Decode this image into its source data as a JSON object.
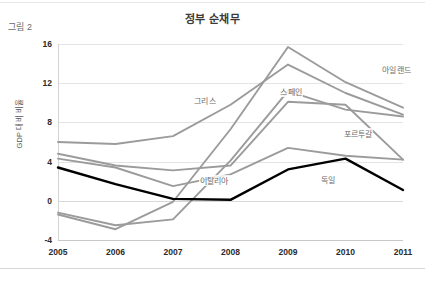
{
  "figure": {
    "caption": "그림 2"
  },
  "chart_data": {
    "type": "line",
    "title": "정부 순채무",
    "xlabel": "",
    "ylabel": "GDP 대비 비율",
    "categories": [
      "2005",
      "2006",
      "2007",
      "2008",
      "2009",
      "2010",
      "2011"
    ],
    "x": [
      2005,
      2006,
      2007,
      2008,
      2009,
      2010,
      2011
    ],
    "ylim": [
      -4,
      16
    ],
    "yticks": [
      "16",
      "12",
      "8",
      "4",
      "0",
      "-4"
    ],
    "ytick_values": [
      16,
      12,
      8,
      4,
      0,
      -4
    ],
    "grid": true,
    "legend": "inline-labels",
    "series": [
      {
        "name": "아일랜드",
        "color": "#9b9b9b",
        "width": 1.9,
        "values": [
          -1.4,
          -2.9,
          -0.1,
          7.3,
          15.7,
          12.1,
          9.5
        ],
        "label_x": 2010.62,
        "label_y": 13.5
      },
      {
        "name": "그리스",
        "color": "#9b9b9b",
        "width": 1.9,
        "values": [
          6.0,
          5.8,
          6.6,
          9.8,
          13.9,
          11.0,
          8.8
        ],
        "label_x": 2007.35,
        "label_y": 10.3
      },
      {
        "name": "스페인",
        "color": "#9b9b9b",
        "width": 1.9,
        "values": [
          -1.2,
          -2.5,
          -1.9,
          4.1,
          11.2,
          9.3,
          8.6
        ],
        "label_x": 2008.85,
        "label_y": 11.2
      },
      {
        "name": "포르투갈",
        "color": "#9b9b9b",
        "width": 1.9,
        "values": [
          4.8,
          3.6,
          3.1,
          3.6,
          10.1,
          9.8,
          4.2
        ],
        "label_x": 2009.95,
        "label_y": 6.9
      },
      {
        "name": "이탈리아",
        "color": "#9b9b9b",
        "width": 1.9,
        "values": [
          4.3,
          3.4,
          1.5,
          2.7,
          5.4,
          4.6,
          4.2
        ],
        "label_x": 2007.45,
        "label_y": 2.1
      },
      {
        "name": "독일",
        "color": "#000000",
        "width": 2.4,
        "values": [
          3.4,
          1.7,
          0.2,
          0.1,
          3.2,
          4.3,
          1.1
        ],
        "label_x": 2009.55,
        "label_y": 2.2
      }
    ]
  }
}
